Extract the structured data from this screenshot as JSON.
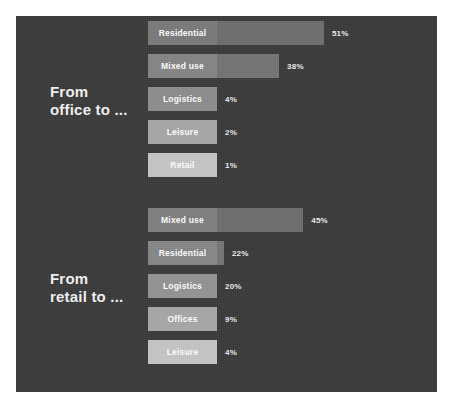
{
  "panel": {
    "background_color": "#3a3a3a"
  },
  "chart_data": {
    "type": "bar",
    "title": "",
    "xlabel": "",
    "ylabel": "",
    "orientation": "horizontal",
    "value_suffix": "%",
    "xlim": [
      0,
      55
    ],
    "grid": false,
    "legend": "none",
    "groups": [
      {
        "name": "from-office",
        "label": "From\noffice to ...",
        "label_line1": "From",
        "label_line2": "office to ...",
        "categories": [
          "Residential",
          "Mixed use",
          "Logistics",
          "Leisure",
          "Retail"
        ],
        "values": [
          51,
          38,
          4,
          2,
          1
        ],
        "value_labels": [
          "51%",
          "38%",
          "4%",
          "2%",
          "1%"
        ],
        "bar_colors": [
          "#6e6e6e",
          "#747474",
          "#7d7d7d",
          "#9b9b9b",
          "#bcbcbc"
        ],
        "label_box_colors": [
          "#7a7a7a",
          "#858585",
          "#8d8d8d",
          "#a8a8a8",
          "#c6c6c6"
        ]
      },
      {
        "name": "from-retail",
        "label": "From\nretail to ...",
        "label_line1": "From",
        "label_line2": "retail to ...",
        "categories": [
          "Mixed use",
          "Residential",
          "Logistics",
          "Offices",
          "Leisure"
        ],
        "values": [
          45,
          22,
          20,
          9,
          4
        ],
        "value_labels": [
          "45%",
          "22%",
          "20%",
          "9%",
          "4%"
        ],
        "bar_colors": [
          "#6e6e6e",
          "#757575",
          "#828282",
          "#9b9b9b",
          "#bcbcbc"
        ],
        "label_box_colors": [
          "#7f7f7f",
          "#878787",
          "#949494",
          "#a8a8a8",
          "#c6c6c6"
        ]
      }
    ]
  }
}
